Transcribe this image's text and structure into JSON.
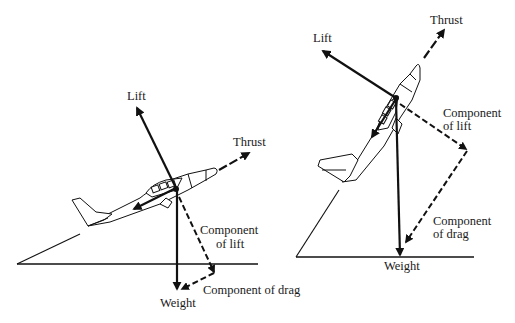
{
  "diagram": {
    "type": "forces-on-airplane-in-climb",
    "colors": {
      "ink": "#111111",
      "background": "#ffffff"
    },
    "left_panel": {
      "description": "Airplane in shallow climb",
      "labels": {
        "lift": "Lift",
        "thrust": "Thrust",
        "weight": "Weight",
        "component_of_lift_line1": "Component",
        "component_of_lift_line2": "of lift",
        "component_of_drag": "Component of drag"
      }
    },
    "right_panel": {
      "description": "Airplane in steep climb",
      "labels": {
        "lift": "Lift",
        "thrust": "Thrust",
        "weight": "Weight",
        "component_of_lift_line1": "Component",
        "component_of_lift_line2": "of lift",
        "component_of_drag_line1": "Component",
        "component_of_drag_line2": "of drag"
      }
    }
  }
}
